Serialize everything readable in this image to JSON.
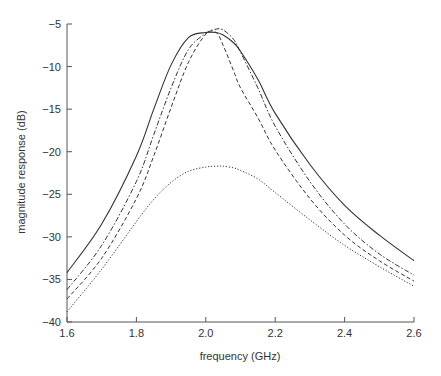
{
  "chart_data": {
    "type": "line",
    "title": "",
    "xlabel": "frequency (GHz)",
    "ylabel": "magnitude response (dB)",
    "xlim": [
      1.6,
      2.6
    ],
    "ylim": [
      -40,
      -5
    ],
    "xticks": [
      "1.6",
      "1.8",
      "2.0",
      "2.2",
      "2.4",
      "2.6"
    ],
    "yticks": [
      "-5",
      "-10",
      "-15",
      "-20",
      "-25",
      "-30",
      "-35",
      "-40"
    ],
    "grid": false,
    "legend": null,
    "x": [
      1.6,
      1.7,
      1.8,
      1.85,
      1.9,
      1.95,
      2.0,
      2.03,
      2.05,
      2.08,
      2.1,
      2.15,
      2.2,
      2.3,
      2.4,
      2.5,
      2.6
    ],
    "series": [
      {
        "name": "solid",
        "style": "solid",
        "values": [
          -34.2,
          -28.5,
          -20.5,
          -15.0,
          -9.8,
          -6.6,
          -6.0,
          -6.0,
          -6.3,
          -7.2,
          -8.2,
          -11.5,
          -15.5,
          -21.5,
          -26.3,
          -29.8,
          -32.8
        ]
      },
      {
        "name": "dash-dot",
        "style": "dashdot",
        "values": [
          -36.2,
          -31.0,
          -23.5,
          -18.0,
          -12.5,
          -8.0,
          -6.1,
          -5.6,
          -5.7,
          -6.8,
          -8.3,
          -12.5,
          -17.0,
          -23.5,
          -28.5,
          -32.0,
          -34.5
        ]
      },
      {
        "name": "dashed",
        "style": "dashed",
        "values": [
          -37.3,
          -32.5,
          -25.5,
          -20.5,
          -14.8,
          -9.5,
          -6.2,
          -6.0,
          -7.5,
          -10.5,
          -12.5,
          -16.0,
          -19.8,
          -25.5,
          -29.8,
          -32.8,
          -35.2
        ]
      },
      {
        "name": "dotted",
        "style": "dotted",
        "values": [
          -38.8,
          -33.8,
          -28.2,
          -25.6,
          -23.6,
          -22.3,
          -21.8,
          -21.7,
          -21.7,
          -21.9,
          -22.2,
          -23.2,
          -24.8,
          -28.0,
          -31.0,
          -33.5,
          -35.8
        ]
      }
    ]
  }
}
